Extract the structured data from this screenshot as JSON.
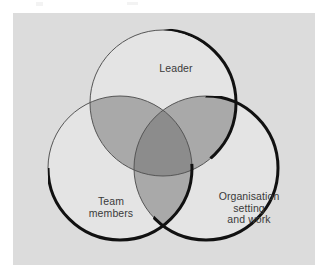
{
  "figure": {
    "type": "venn-diagram-3-set",
    "panel": {
      "background_color": "#dcdcdc",
      "x": 13,
      "y": 13,
      "width": 302,
      "height": 252
    },
    "colors": {
      "page_background": "#ffffff",
      "panel_background": "#dcdcdc",
      "circle_fill": "#e4e4e4",
      "pairwise_overlap": "#a9a9a9",
      "triple_overlap": "#8c8c8c",
      "circle_outline": "#555555",
      "shadow_arc": "#111111",
      "label_text": "#3a3a3a"
    },
    "circles": [
      {
        "id": "leader",
        "label": "Leader",
        "position": "top",
        "center_x": 150,
        "center_y": 90,
        "radius": 73
      },
      {
        "id": "team-members",
        "label": "Team\nmembers",
        "position": "bottom-left",
        "center_x": 107,
        "center_y": 155,
        "radius": 72
      },
      {
        "id": "organisation",
        "label": "Organisation\nsetting\nand work",
        "position": "bottom-right",
        "center_x": 193,
        "center_y": 155,
        "radius": 72
      }
    ],
    "artifacts": [
      {
        "id": "scan-mark-left"
      },
      {
        "id": "scan-mark-center"
      }
    ]
  }
}
